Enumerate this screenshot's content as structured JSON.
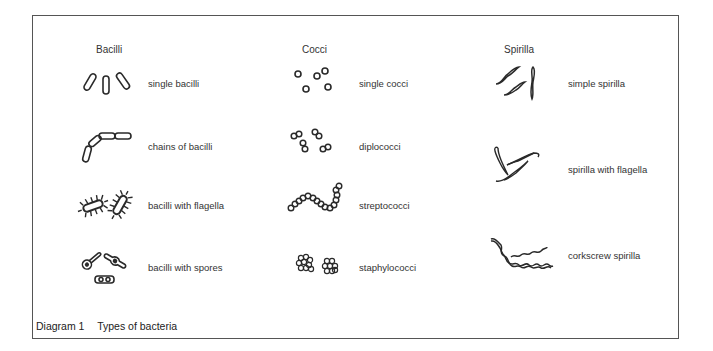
{
  "figure": {
    "caption_number": "Diagram 1",
    "caption_title": "Types of bacteria"
  },
  "columns": [
    {
      "title": "Bacilli",
      "items": [
        {
          "label": "single bacilli",
          "icon": "single-bacilli-icon"
        },
        {
          "label": "chains of bacilli",
          "icon": "chain-bacilli-icon"
        },
        {
          "label": "bacilli with flagella",
          "icon": "flagellated-bacilli-icon"
        },
        {
          "label": "bacilli with spores",
          "icon": "spore-bacilli-icon"
        }
      ]
    },
    {
      "title": "Cocci",
      "items": [
        {
          "label": "single cocci",
          "icon": "single-cocci-icon"
        },
        {
          "label": "diplococci",
          "icon": "diplococci-icon"
        },
        {
          "label": "streptococci",
          "icon": "streptococci-icon"
        },
        {
          "label": "staphylococci",
          "icon": "staphylococci-icon"
        }
      ]
    },
    {
      "title": "Spirilla",
      "items": [
        {
          "label": "simple spirilla",
          "icon": "simple-spirilla-icon"
        },
        {
          "label": "spirilla with flagella",
          "icon": "flagellated-spirilla-icon"
        },
        {
          "label": "corkscrew spirilla",
          "icon": "corkscrew-spirilla-icon"
        }
      ]
    }
  ],
  "colors": {
    "ink": "#2a2a2a",
    "border": "#555555",
    "background": "#ffffff"
  }
}
